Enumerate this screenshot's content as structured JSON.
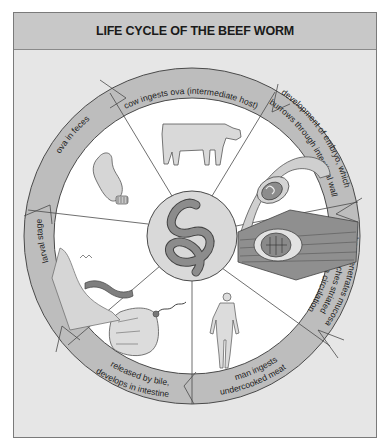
{
  "title": "LIFE CYCLE OF THE BEEF WORM",
  "colors": {
    "frame_bg": "#e6e6e6",
    "title_bg": "#c8c8c8",
    "ring": "#bdbdbd",
    "ring_stroke": "#4a4a4a",
    "segment_bg": "#ffffff",
    "worm_fill": "#8c8c8c",
    "tissue_fill": "#a8a8a8"
  },
  "stages": [
    {
      "id": "cow-ingests",
      "label": "cow ingests ova (intermediate host)",
      "illustration": "cow"
    },
    {
      "id": "embryo-development",
      "label": "development of embryo, which burrows through intestinal wall",
      "illustration": "intestinal-wall-embryo"
    },
    {
      "id": "embryo-penetrates",
      "label": "embryo penetrates mucosa and reaches striated muscle via circulation",
      "illustration": "cyst-in-muscle"
    },
    {
      "id": "man-ingests",
      "label": "man ingests undercooked meat",
      "illustration": "human-figure"
    },
    {
      "id": "released-by-bile",
      "label": "released by bile, develops in intestine",
      "illustration": "scolex-in-intestine"
    },
    {
      "id": "larval-stage",
      "label": "larval stage",
      "illustration": "larva-in-intestine"
    },
    {
      "id": "ova-in-feces",
      "label": "ova in feces",
      "illustration": "intestine-with-ova"
    }
  ],
  "center": {
    "illustration": "adult-beef-worm"
  },
  "ring_labels": {
    "cow": "cow ingests ova (intermediate host)",
    "dev_line1": "development of embryo, which",
    "dev_line2": "burrows through intestinal wall",
    "pen_line1": "embryo penetrates mucosa",
    "pen_line2": "and reaches striated",
    "pen_line3": "muscle via circulation",
    "man_line1": "man ingests",
    "man_line2": "undercooked meat",
    "bile_line1": "released by bile,",
    "bile_line2": "develops in intestine",
    "larval": "larval stage",
    "ova": "ova in feces"
  }
}
